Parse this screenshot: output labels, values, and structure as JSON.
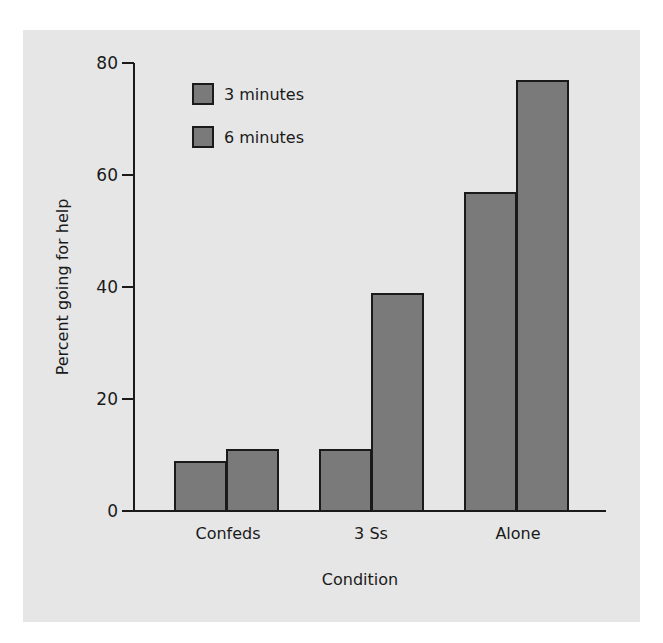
{
  "chart_data": {
    "type": "bar",
    "title": "",
    "xlabel": "Condition",
    "ylabel": "Percent going for help",
    "ylim": [
      0,
      80
    ],
    "yticks": [
      0,
      20,
      40,
      60,
      80
    ],
    "grid": false,
    "legend_position": "upper-left",
    "categories": [
      "Confeds",
      "3 Ss",
      "Alone"
    ],
    "series": [
      {
        "name": "3 minutes",
        "values": [
          9,
          11,
          57
        ],
        "color": "#7a7a7a"
      },
      {
        "name": "6 minutes",
        "values": [
          11,
          39,
          77
        ],
        "color": "#7a7a7a"
      }
    ]
  },
  "axis": {
    "ticks": [
      "0",
      "20",
      "40",
      "60",
      "80"
    ],
    "xlabel": "Condition",
    "ylabel": "Percent going for help"
  },
  "legend": [
    "3 minutes",
    "6 minutes"
  ],
  "categories": [
    "Confeds",
    "3 Ss",
    "Alone"
  ]
}
